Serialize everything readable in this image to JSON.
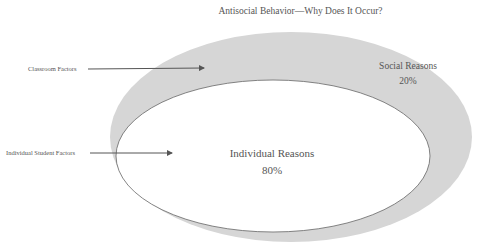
{
  "title": "Antisocial Behavior—Why Does It Occur?",
  "callouts": {
    "classroom": "Classroom Factors",
    "individual_student": "Individual Student Factors"
  },
  "regions": {
    "outer": {
      "label": "Social Reasons",
      "value": "20%"
    },
    "inner": {
      "label": "Individual Reasons",
      "value": "80%"
    }
  },
  "colors": {
    "outer_fill": "#d6d6d6",
    "inner_fill": "#ffffff",
    "stroke": "#666666",
    "arrow": "#555555"
  }
}
